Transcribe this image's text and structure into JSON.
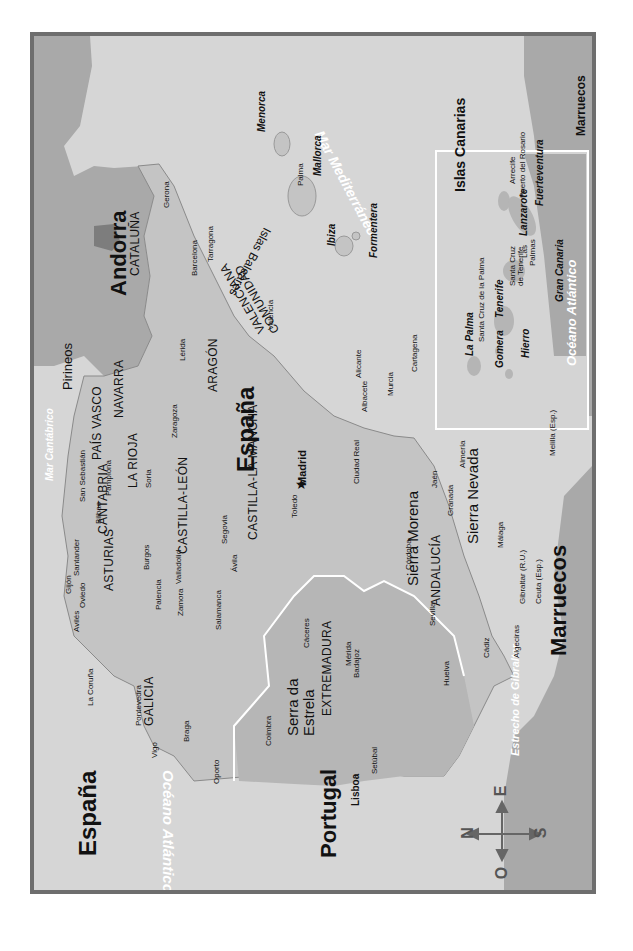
{
  "map": {
    "title_country": "España",
    "colors": {
      "frame": "#6e6e6e",
      "sea": "#d6d6d6",
      "foreign_land": "#a9a9a9",
      "spain_land": "#c4c4c4",
      "portugal_land": "#b6b6b6",
      "border_white": "#ffffff"
    },
    "countries": {
      "spain_corner": "España",
      "spain_center": "España",
      "portugal": "Portugal",
      "andorra": "Andorra",
      "marruecos": "Marruecos"
    },
    "seas": {
      "atlantic": "Océano Atlántico",
      "cantabrico": "Mar Cantábrico",
      "mediterraneo": "Mar Mediterráneo",
      "gibraltar": "Estrecho de Gibraltar",
      "atlantic_canarias": "Océano Atlántico"
    },
    "regions": {
      "galicia": "GALICIA",
      "asturias": "ASTURIAS",
      "cantabria": "CANTABRIA",
      "pais_vasco": "PAÍS VASCO",
      "navarra": "NAVARRA",
      "la_rioja": "LA RIOJA",
      "aragon": "ARAGÓN",
      "cataluna": "CATALUÑA",
      "castilla_leon": "CASTILLA-LEÓN",
      "castilla_la_mancha": "CASTILLA-LA MANCHA",
      "comunidad_valenciana_1": "COMUNIDAD",
      "comunidad_valenciana_2": "VALENCIANA",
      "extremadura": "EXTREMADURA",
      "andalucia": "ANDALUCÍA"
    },
    "mountains": {
      "pirineos": "Pirineos",
      "sierra_morena": "Sierra Morena",
      "sierra_nevada": "Sierra Nevada",
      "serra_estrela_1": "Serra da",
      "serra_estrela_2": "Estrela"
    },
    "cities": {
      "madrid": "Madrid",
      "lisboa": "Lisboa",
      "gerona": "Gerona",
      "barcelona": "Barcelona",
      "tarragona": "Tarragona",
      "lerida": "Lérida",
      "zaragoza": "Zaragoza",
      "pamplona": "Pamplona",
      "san_sebastian": "San Sebastián",
      "bilbao": "Bilbao",
      "santander": "Santander",
      "gijon": "Gijón",
      "oviedo": "Oviedo",
      "aviles": "Avilés",
      "la_coruna": "La Coruña",
      "pontevedra": "Pontevedra",
      "vigo": "Vigo",
      "braga": "Braga",
      "oporto": "Oporto",
      "coimbra": "Coimbra",
      "setubal": "Setúbal",
      "burgos": "Burgos",
      "soria": "Soria",
      "palencia": "Palencia",
      "valladolid": "Valladolid",
      "zamora": "Zamora",
      "salamanca": "Salamanca",
      "avila": "Ávila",
      "segovia": "Segovia",
      "toledo": "Toledo",
      "ciudad_real": "Ciudad Real",
      "caceres": "Cáceres",
      "merida": "Mérida",
      "badajoz": "Badajoz",
      "valencia": "Valencia",
      "alicante": "Alicante",
      "albacete": "Albacete",
      "murcia": "Murcia",
      "cartagena": "Cartagena",
      "jaen": "Jaén",
      "cordoba": "Córdoba",
      "granada": "Granada",
      "almeria": "Almería",
      "sevilla": "Sevilla",
      "huelva": "Huelva",
      "cadiz": "Cádiz",
      "malaga": "Málaga",
      "gibraltar": "Gibraltar (R.U.)",
      "algeciras": "Algeciras",
      "ceuta": "Ceuta (Esp.)",
      "melilla": "Melilla (Esp.)",
      "palma": "Palma"
    },
    "baleares": {
      "group": "Islas Baleares",
      "menorca": "Menorca",
      "mallorca": "Mallorca",
      "ibiza": "Ibiza",
      "formentera": "Formentera"
    },
    "canarias": {
      "title": "Islas Canarias",
      "marruecos": "Marruecos",
      "la_palma": "La Palma",
      "santa_cruz_palma": "Santa Cruz de la Palma",
      "tenerife": "Tenerife",
      "santa_cruz_tenerife_1": "Santa Cruz",
      "santa_cruz_tenerife_2": "de Tenerife",
      "gomera": "Gomera",
      "hierro": "Hierro",
      "gran_canaria": "Gran Canaria",
      "las_palmas_1": "Las",
      "las_palmas_2": "Palmas",
      "lanzarote": "Lanzarote",
      "arrecife": "Arrecife",
      "puerto_rosario": "Puerto del Rosario",
      "fuerteventura": "Fuerteventura"
    },
    "compass": {
      "n": "N",
      "s": "S",
      "e": "E",
      "o": "O"
    }
  }
}
